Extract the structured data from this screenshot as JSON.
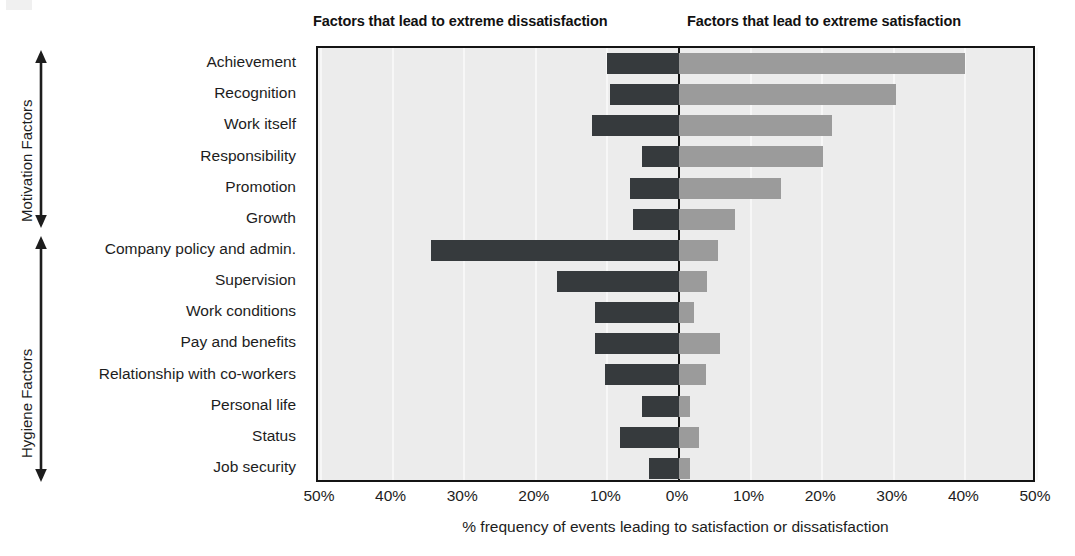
{
  "headers": {
    "left": "Factors that lead to extreme dissatisfaction",
    "right": "Factors that lead to extreme satisfaction"
  },
  "groups": [
    {
      "id": "motivation",
      "label": "Motivation Factors"
    },
    {
      "id": "hygiene",
      "label": "Hygiene Factors"
    }
  ],
  "axis": {
    "xlabel": "% frequency of events leading to satisfaction or dissatisfaction",
    "ticks": [
      "50%",
      "40%",
      "30%",
      "20%",
      "10%",
      "0%",
      "10%",
      "20%",
      "30%",
      "40%",
      "50%"
    ],
    "tick_values": [
      -50,
      -40,
      -30,
      -20,
      -10,
      0,
      10,
      20,
      30,
      40,
      50
    ]
  },
  "colors": {
    "dissatisfaction_bar": "#363a3d",
    "satisfaction_bar": "#9b9b9b",
    "plot_background": "#ececec",
    "frame": "#141414",
    "gridline": "#f7f7f7"
  },
  "chart_data": {
    "type": "bar",
    "title": "",
    "orientation": "horizontal-diverging",
    "xlabel": "% frequency of events leading to satisfaction or dissatisfaction",
    "ylabel": "",
    "xlim": [
      -50,
      50
    ],
    "grid": true,
    "legend_position": "top",
    "categories": [
      "Achievement",
      "Recognition",
      "Work itself",
      "Responsibility",
      "Promotion",
      "Growth",
      "Company policy and admin.",
      "Supervision",
      "Work conditions",
      "Pay and benefits",
      "Relationship with co-workers",
      "Personal life",
      "Status",
      "Job security"
    ],
    "category_groups": [
      "Motivation Factors",
      "Motivation Factors",
      "Motivation Factors",
      "Motivation Factors",
      "Motivation Factors",
      "Motivation Factors",
      "Hygiene Factors",
      "Hygiene Factors",
      "Hygiene Factors",
      "Hygiene Factors",
      "Hygiene Factors",
      "Hygiene Factors",
      "Hygiene Factors",
      "Hygiene Factors"
    ],
    "series": [
      {
        "name": "Factors that lead to extreme dissatisfaction",
        "color": "#363a3d",
        "direction": "left",
        "values": [
          10,
          9.6,
          12.2,
          5.1,
          6.9,
          6.4,
          34.7,
          17.1,
          11.7,
          11.7,
          10.3,
          5.1,
          8.2,
          4.2
        ]
      },
      {
        "name": "Factors that lead to extreme satisfaction",
        "color": "#9b9b9b",
        "direction": "right",
        "values": [
          40,
          30.3,
          21.3,
          20.1,
          14.3,
          7.8,
          5.4,
          3.9,
          2.1,
          5.7,
          3.8,
          1.5,
          2.8,
          1.5
        ]
      }
    ]
  }
}
